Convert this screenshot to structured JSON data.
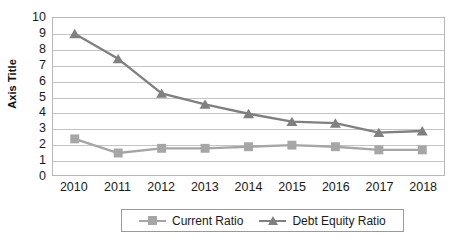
{
  "chart_data": {
    "type": "line",
    "title": "",
    "xlabel": "",
    "ylabel": "Axis Title",
    "categories": [
      "2010",
      "2011",
      "2012",
      "2013",
      "2014",
      "2015",
      "2016",
      "2017",
      "2018"
    ],
    "series": [
      {
        "name": "Current Ratio",
        "marker": "square",
        "color": "#A6A6A6",
        "values": [
          2.3,
          1.4,
          1.7,
          1.7,
          1.8,
          1.9,
          1.8,
          1.6,
          1.6
        ]
      },
      {
        "name": "Debt Equity Ratio",
        "marker": "triangle",
        "color": "#808080",
        "values": [
          9.0,
          7.4,
          5.2,
          4.5,
          3.9,
          3.4,
          3.3,
          2.7,
          2.8
        ]
      }
    ],
    "ylim": [
      0,
      10
    ],
    "yticks": [
      "0",
      "1",
      "2",
      "3",
      "4",
      "5",
      "6",
      "7",
      "8",
      "9",
      "10"
    ],
    "grid": true,
    "legend_position": "bottom"
  },
  "legend": {
    "entries": [
      {
        "label": "Current Ratio",
        "marker": "square-marker-icon",
        "color": "#A6A6A6"
      },
      {
        "label": "Debt Equity Ratio",
        "marker": "triangle-marker-icon",
        "color": "#808080"
      }
    ]
  },
  "axes": {
    "y_title": "Axis Title",
    "y_tick_labels": [
      "10",
      "9",
      "8",
      "7",
      "6",
      "5",
      "4",
      "3",
      "2",
      "1",
      "0"
    ],
    "x_tick_labels": [
      "2010",
      "2011",
      "2012",
      "2013",
      "2014",
      "2015",
      "2016",
      "2017",
      "2018"
    ]
  },
  "colors": {
    "plot_border": "#b7b7b7",
    "gridline": "#c4c4c4",
    "current_ratio": "#A6A6A6",
    "debt_equity_ratio": "#808080",
    "background": "#ffffff",
    "text": "#1a1a1a"
  }
}
